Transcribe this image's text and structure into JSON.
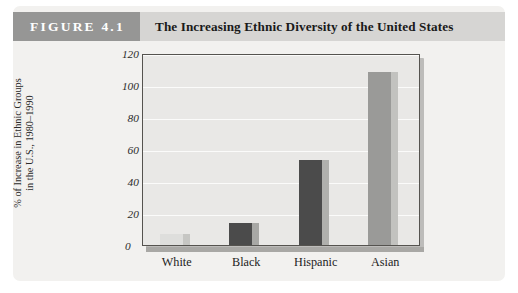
{
  "figure": {
    "number_label": "FIGURE 4.1",
    "title": "The Increasing Ethnic Diversity of the United States",
    "number_band_color": "#969695",
    "title_band_color": "#d6d5d3",
    "card_color": "#f2f1ef"
  },
  "chart_data": {
    "type": "bar",
    "title": "The Increasing Ethnic Diversity of the United States",
    "categories": [
      "White",
      "Black",
      "Hispanic",
      "Asian"
    ],
    "values": [
      7,
      14,
      53,
      108
    ],
    "series": [
      {
        "name": "% of Increase in Ethnic Groups in the U.S., 1980-1990",
        "values": [
          7,
          14,
          53,
          108
        ]
      }
    ],
    "bar_colors": [
      "#dededc",
      "#4b4b4b",
      "#4b4b4b",
      "#9a9a98"
    ],
    "bar_side_colors": [
      "#c6c6c3",
      "#a8a8a5",
      "#b0b0ad",
      "#c2c2bf"
    ],
    "xlabel": "",
    "ylabel_line1": "% of Increase in Ethnic Groups",
    "ylabel_line2": "in the U.S., 1980–1990",
    "ylim": [
      0,
      120
    ],
    "yticks": [
      0,
      20,
      40,
      60,
      80,
      100,
      120
    ],
    "ytick_labels": [
      "0",
      "20",
      "40",
      "60",
      "80",
      "100",
      "120"
    ],
    "grid": true,
    "gridline_color": "#fbfbfa",
    "legend": "none",
    "plot_background": "#e9e8e6",
    "plot_border_color": "#55534f"
  }
}
